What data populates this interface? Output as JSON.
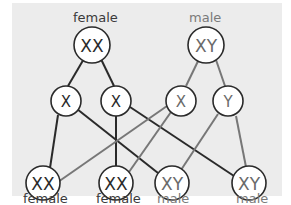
{
  "diagram": {
    "type": "sex-chromosome inheritance (Punnett-style cross)",
    "colors": {
      "panel_bg": "#ececec",
      "female_line": "#2a2a2a",
      "male_line": "#777777",
      "node_fill": "#ffffff"
    },
    "parents": [
      {
        "id": "mother",
        "label": "female",
        "genotype": "XX"
      },
      {
        "id": "father",
        "label": "male",
        "genotype": "XY"
      }
    ],
    "gametes": [
      {
        "id": "m1",
        "from": "mother",
        "chromosome": "X"
      },
      {
        "id": "m2",
        "from": "mother",
        "chromosome": "X"
      },
      {
        "id": "f1",
        "from": "father",
        "chromosome": "X"
      },
      {
        "id": "f2",
        "from": "father",
        "chromosome": "Y"
      }
    ],
    "offspring": [
      {
        "id": "o1",
        "genotype": "XX",
        "label": "female",
        "from": [
          "m1",
          "f1"
        ]
      },
      {
        "id": "o2",
        "genotype": "XX",
        "label": "female",
        "from": [
          "m2",
          "f1"
        ]
      },
      {
        "id": "o3",
        "genotype": "XY",
        "label": "male",
        "from": [
          "m1",
          "f2"
        ]
      },
      {
        "id": "o4",
        "genotype": "XY",
        "label": "male",
        "from": [
          "m2",
          "f2"
        ]
      }
    ]
  }
}
